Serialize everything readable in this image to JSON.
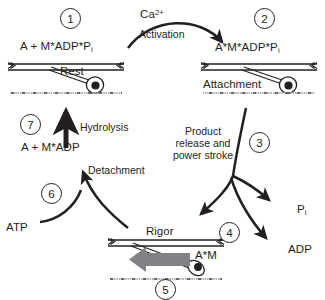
{
  "diagram": {
    "background": "#ffffff",
    "ink": "#231f20",
    "slide_arrow_color": "#808285"
  },
  "steps": [
    {
      "id": "1",
      "label": "1"
    },
    {
      "id": "2",
      "label": "2"
    },
    {
      "id": "3",
      "label": "3"
    },
    {
      "id": "4",
      "label": "4"
    },
    {
      "id": "5",
      "label": "5"
    },
    {
      "id": "6",
      "label": "6"
    },
    {
      "id": "7",
      "label": "7"
    }
  ],
  "chemistry": {
    "rest": {
      "main": "A + M*ADP*P",
      "sub": "i"
    },
    "attachment": {
      "main": "A*M*ADP*P",
      "sub": "i"
    },
    "detached": {
      "main": "A + M*ADP"
    },
    "rigor": {
      "main": "A*M"
    },
    "atp": "ATP",
    "adp": "ADP",
    "pi": {
      "main": "P",
      "sub": "i"
    },
    "calcium": {
      "main": "Ca",
      "sup": "2+"
    }
  },
  "state_labels": {
    "rest": "Rest",
    "attachment": "Attachment",
    "rigor": "Rigor"
  },
  "process_labels": {
    "activation": "Activation",
    "power_stroke": "Product release and power stroke",
    "hydrolysis": "Hydrolysis",
    "detachment": "Detachment"
  },
  "filaments": {
    "thick_filament_name": "myosin thick filament",
    "thin_filament_name": "actin thin filament",
    "crossbridge_name": "myosin cross-bridge",
    "head_name": "myosin head"
  }
}
